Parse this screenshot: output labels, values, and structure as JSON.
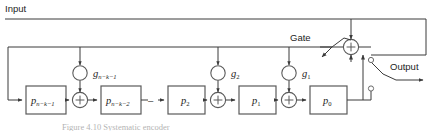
{
  "figure": {
    "domain_type": "diagram",
    "diagram_kind": "linear-feedback-shift-register-encoder",
    "background_color": "#ffffff",
    "line_color": "#3b3b3b",
    "box_stroke_color": "#5a5a5a",
    "text_color": "#1d1d1d",
    "width": 431,
    "height": 131
  },
  "labels": {
    "input": "Input",
    "output": "Output",
    "gate": "Gate"
  },
  "registers": [
    {
      "id": "reg-n-k-1",
      "base": "p",
      "sub": "n−k−1",
      "x": 26,
      "y": 86,
      "w": 40,
      "h": 28
    },
    {
      "id": "reg-n-k-2",
      "base": "p",
      "sub": "n−k−2",
      "x": 101,
      "y": 86,
      "w": 40,
      "h": 28
    },
    {
      "id": "reg-2",
      "base": "p",
      "sub": "2",
      "x": 168,
      "y": 86,
      "w": 37,
      "h": 28
    },
    {
      "id": "reg-1",
      "base": "p",
      "sub": "1",
      "x": 239,
      "y": 86,
      "w": 37,
      "h": 28
    },
    {
      "id": "reg-0",
      "base": "p",
      "sub": "0",
      "x": 310,
      "y": 86,
      "w": 37,
      "h": 28
    }
  ],
  "taps": [
    {
      "id": "tap-g-n-k-1",
      "base": "g",
      "sub": "n−k−1",
      "cx": 80,
      "cy": 73
    },
    {
      "id": "tap-g-2",
      "base": "g",
      "sub": "2",
      "cx": 218,
      "cy": 73
    },
    {
      "id": "tap-g-1",
      "base": "g",
      "sub": "1",
      "cx": 289,
      "cy": 73
    }
  ],
  "adders": [
    {
      "id": "adder-left",
      "cx": 80,
      "cy": 100
    },
    {
      "id": "adder-mid",
      "cx": 218,
      "cy": 100
    },
    {
      "id": "adder-right",
      "cx": 289,
      "cy": 100
    },
    {
      "id": "adder-gate",
      "cx": 351,
      "cy": 47
    }
  ],
  "ellipsis": {
    "id": "dash-ellipsis",
    "text": "–",
    "x": 152,
    "y": 101
  },
  "caption": {
    "text": "Figure 4.10   Systematic encoder"
  }
}
